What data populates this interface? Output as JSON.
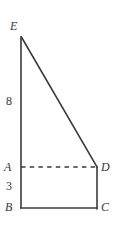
{
  "figure": {
    "stroke_color": "#3a3a3a",
    "background_color": "#ffffff",
    "vertices": {
      "E": {
        "label": "E",
        "x": 21,
        "y": 37
      },
      "A": {
        "label": "A",
        "x": 21,
        "y": 167
      },
      "B": {
        "label": "B",
        "x": 21,
        "y": 208
      },
      "D": {
        "label": "D",
        "x": 97,
        "y": 167
      },
      "C": {
        "label": "C",
        "x": 97,
        "y": 208
      }
    },
    "segments": [
      {
        "name": "EB-left-vertical",
        "from": "E",
        "to": "B",
        "style": "solid"
      },
      {
        "name": "ED-hypotenuse",
        "from": "E",
        "to": "D",
        "style": "solid"
      },
      {
        "name": "BC-bottom",
        "from": "B",
        "to": "C",
        "style": "solid"
      },
      {
        "name": "DC-right-vertical",
        "from": "D",
        "to": "C",
        "style": "solid"
      },
      {
        "name": "AD-dashed",
        "from": "A",
        "to": "D",
        "style": "dashed"
      }
    ],
    "measurements": {
      "EA": "8",
      "AB": "3"
    }
  }
}
